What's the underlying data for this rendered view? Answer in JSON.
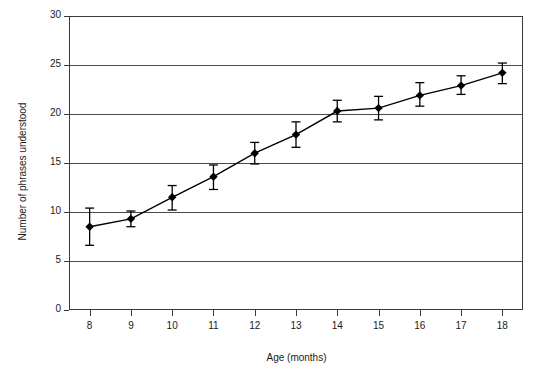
{
  "chart_data": {
    "type": "line",
    "title": "",
    "xlabel": "Age (months)",
    "ylabel": "Number of phrases understood",
    "x": [
      8,
      9,
      10,
      11,
      12,
      13,
      14,
      15,
      16,
      17,
      18
    ],
    "xtick_labels": [
      "8",
      "9",
      "10",
      "11",
      "12",
      "13",
      "14",
      "15",
      "16",
      "17",
      "18"
    ],
    "ytick_labels": [
      "0",
      "5",
      "10",
      "15",
      "20",
      "25",
      "30"
    ],
    "yticks": [
      0,
      5,
      10,
      15,
      20,
      25,
      30
    ],
    "xlim": [
      7.5,
      18.5
    ],
    "ylim": [
      0,
      30
    ],
    "grid": "horizontal",
    "legend": "none",
    "marker": "filled-diamond",
    "series": [
      {
        "name": "Phrases understood",
        "values": [
          8.5,
          9.3,
          11.5,
          13.6,
          16.0,
          17.9,
          20.3,
          20.6,
          21.9,
          22.9,
          24.2
        ],
        "error_low": [
          6.6,
          8.5,
          10.2,
          12.3,
          14.9,
          16.6,
          19.2,
          19.4,
          20.8,
          22.0,
          23.1
        ],
        "error_high": [
          10.4,
          10.1,
          12.7,
          14.8,
          17.1,
          19.2,
          21.4,
          21.8,
          23.2,
          23.9,
          25.2
        ]
      }
    ]
  },
  "colors": {
    "line": "#000000",
    "marker": "#000000",
    "grid": "#4a4a4a",
    "axis": "#3a3a3a",
    "background": "#ffffff",
    "text": "#1a1a1a"
  }
}
